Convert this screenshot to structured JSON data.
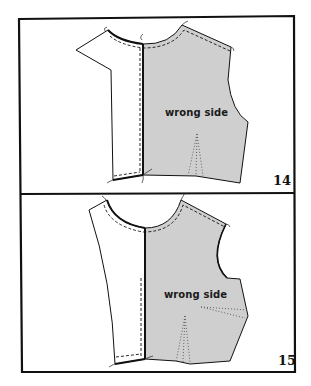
{
  "figure": {
    "colors": {
      "fabric_wrong_side": "#cfcfcf",
      "outline": "#111111",
      "background": "#ffffff"
    },
    "panels": [
      {
        "step_number": "14",
        "fabric_label": "wrong side"
      },
      {
        "step_number": "15",
        "fabric_label": "wrong side"
      }
    ]
  }
}
